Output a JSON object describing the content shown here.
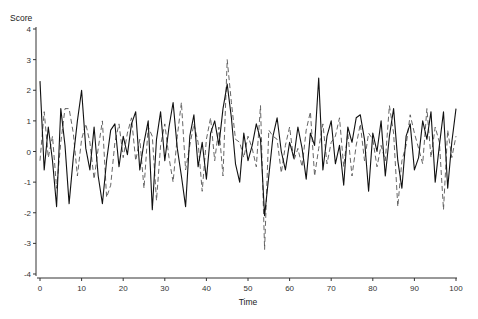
{
  "chart_data": {
    "type": "line",
    "title": "",
    "xlabel": "Time",
    "ylabel": "Score",
    "xlim": [
      0,
      100
    ],
    "ylim": [
      -4,
      4
    ],
    "xticks": [
      0,
      10,
      20,
      30,
      40,
      50,
      60,
      70,
      80,
      90,
      100
    ],
    "yticks": [
      -4,
      -3,
      -2,
      -1,
      0,
      1,
      2,
      3,
      4
    ],
    "grid": false,
    "legend": null,
    "x": [
      0,
      1,
      2,
      3,
      4,
      5,
      6,
      7,
      8,
      9,
      10,
      11,
      12,
      13,
      14,
      15,
      16,
      17,
      18,
      19,
      20,
      21,
      22,
      23,
      24,
      25,
      26,
      27,
      28,
      29,
      30,
      31,
      32,
      33,
      34,
      35,
      36,
      37,
      38,
      39,
      40,
      41,
      42,
      43,
      44,
      45,
      46,
      47,
      48,
      49,
      50,
      51,
      52,
      53,
      54,
      55,
      56,
      57,
      58,
      59,
      60,
      61,
      62,
      63,
      64,
      65,
      66,
      67,
      68,
      69,
      70,
      71,
      72,
      73,
      74,
      75,
      76,
      77,
      78,
      79,
      80,
      81,
      82,
      83,
      84,
      85,
      86,
      87,
      88,
      89,
      90,
      91,
      92,
      93,
      94,
      95,
      96,
      97,
      98,
      99,
      100
    ],
    "series": [
      {
        "name": "Series 1 (solid)",
        "style": "solid",
        "color": "#111111",
        "values": [
          2.3,
          -0.6,
          0.8,
          -0.3,
          -1.8,
          1.4,
          0.2,
          -1.7,
          -0.2,
          1.0,
          2.0,
          0.1,
          -0.6,
          0.8,
          -0.8,
          -1.7,
          -0.3,
          0.7,
          0.9,
          -0.5,
          0.5,
          -0.1,
          0.9,
          1.3,
          -0.6,
          0.3,
          1.0,
          -1.9,
          0.4,
          1.3,
          -0.3,
          0.8,
          1.6,
          0.1,
          -0.8,
          -1.8,
          0.5,
          1.2,
          -0.5,
          0.3,
          -0.9,
          0.6,
          1.0,
          0.2,
          1.4,
          2.2,
          1.1,
          -0.4,
          -1.0,
          0.6,
          -0.3,
          0.2,
          0.9,
          0.4,
          -2.1,
          -0.8,
          0.5,
          1.1,
          0.0,
          -0.6,
          0.3,
          -0.2,
          0.8,
          0.1,
          -0.9,
          0.6,
          0.2,
          2.4,
          -0.6,
          0.5,
          1.0,
          -0.4,
          0.2,
          -1.1,
          0.8,
          0.3,
          1.1,
          1.2,
          0.4,
          -1.3,
          0.6,
          0.0,
          1.0,
          -0.8,
          0.5,
          1.4,
          -0.3,
          -1.2,
          0.5,
          0.9,
          -0.6,
          -0.2,
          1.0,
          0.4,
          1.3,
          -1.0,
          0.2,
          1.3,
          -1.2,
          0.3,
          1.4
        ]
      },
      {
        "name": "Series 2 (dashed)",
        "style": "dashed",
        "color": "#555555",
        "values": [
          -0.3,
          1.3,
          -0.2,
          0.5,
          -1.2,
          0.3,
          1.4,
          1.4,
          0.6,
          -0.8,
          0.4,
          0.9,
          0.3,
          -0.9,
          0.1,
          1.0,
          -1.5,
          -1.1,
          0.3,
          0.9,
          -0.2,
          0.6,
          1.1,
          -0.3,
          0.4,
          -1.2,
          0.8,
          0.5,
          -1.6,
          0.2,
          0.9,
          -0.2,
          -1.0,
          0.5,
          1.6,
          -0.6,
          0.2,
          0.9,
          0.3,
          -1.3,
          0.4,
          1.1,
          -0.3,
          0.8,
          -0.8,
          3.0,
          1.6,
          0.4,
          0.3,
          -0.2,
          0.5,
          0.1,
          -0.5,
          1.5,
          -3.2,
          0.7,
          0.5,
          0.4,
          -0.7,
          0.2,
          0.8,
          -0.3,
          0.1,
          -0.5,
          0.7,
          1.3,
          -0.8,
          0.1,
          0.9,
          -0.4,
          0.3,
          0.5,
          1.1,
          -0.5,
          0.6,
          -0.8,
          0.2,
          0.9,
          -0.3,
          0.6,
          0.4,
          -0.5,
          0.2,
          -0.3,
          1.5,
          0.6,
          -1.8,
          -0.3,
          0.2,
          1.2,
          0.6,
          0.1,
          -0.4,
          1.4,
          -0.2,
          0.8,
          0.3,
          -1.9,
          0.7,
          -0.2,
          0.5
        ]
      }
    ]
  }
}
